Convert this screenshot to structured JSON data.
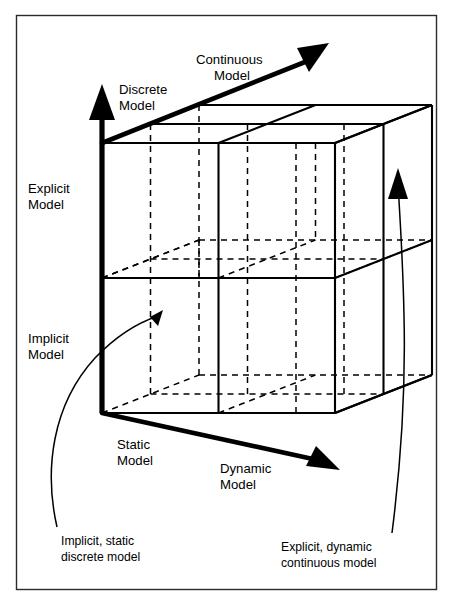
{
  "figure": {
    "background_color": "#ffffff",
    "line_color": "#000000",
    "frame_color": "#2b2b2b"
  },
  "axes": [
    {
      "id": "vertical",
      "name": "explicit-implicit-axis",
      "low_label": "Implicit\nModel",
      "low_label_line1": "Implicit",
      "low_label_line2": "Model",
      "high_label_line1": "Explicit",
      "high_label_line2": "Model",
      "direction": "up"
    },
    {
      "id": "depth",
      "name": "discrete-continuous-axis",
      "low_label_line1": "Discrete",
      "low_label_line2": "Model",
      "high_label_line1": "Continuous",
      "high_label_line2": "Model",
      "direction": "up-right"
    },
    {
      "id": "horizontal",
      "name": "static-dynamic-axis",
      "low_label_line1": "Static",
      "low_label_line2": "Model",
      "high_label_line1": "Dynamic",
      "high_label_line2": "Model",
      "direction": "right"
    }
  ],
  "labels": {
    "continuous_model_l1": "Continuous",
    "continuous_model_l2": "Model",
    "discrete_model_l1": "Discrete",
    "discrete_model_l2": "Model",
    "explicit_model_l1": "Explicit",
    "explicit_model_l2": "Model",
    "implicit_model_l1": "Implicit",
    "implicit_model_l2": "Model",
    "static_model_l1": "Static",
    "static_model_l2": "Model",
    "dynamic_model_l1": "Dynamic",
    "dynamic_model_l2": "Model"
  },
  "callouts": [
    {
      "id": "left-callout",
      "name": "implicit-static-discrete-callout",
      "line1": "Implicit, static",
      "line2": "discrete model",
      "points_to": "front-bottom-left cell"
    },
    {
      "id": "right-callout",
      "name": "explicit-dynamic-continuous-callout",
      "line1": "Explicit, dynamic",
      "line2": "continuous model",
      "points_to": "back-top-right cell"
    }
  ],
  "cube": {
    "divisions_x": 2,
    "divisions_y": 2,
    "divisions_z": 2,
    "total_cells": 8
  }
}
